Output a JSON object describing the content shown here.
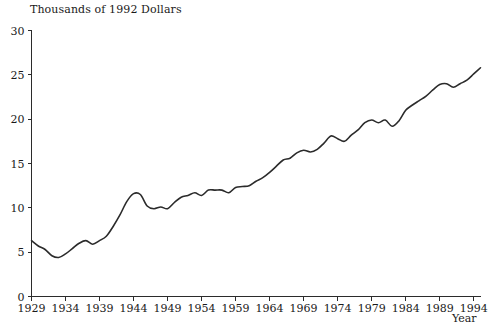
{
  "chart_data": {
    "type": "line",
    "title": "Thousands of 1992 Dollars",
    "subtitle": "",
    "xlabel": "Year",
    "ylabel": "",
    "xlim": [
      1929,
      1995
    ],
    "ylim": [
      0,
      30
    ],
    "grid": false,
    "legend": "none",
    "line_color": "#2b2b2b",
    "x_ticks": [
      1929,
      1934,
      1939,
      1944,
      1949,
      1954,
      1959,
      1964,
      1969,
      1974,
      1979,
      1984,
      1989,
      1994
    ],
    "x_tick_labels": [
      "1929",
      "1934",
      "1939",
      "1944",
      "1949",
      "1954",
      "1959",
      "1964",
      "1969",
      "1974",
      "1979",
      "1984",
      "1989",
      "1994"
    ],
    "y_ticks": [
      0,
      5,
      10,
      15,
      20,
      25,
      30
    ],
    "y_tick_labels": [
      "0",
      "5",
      "10",
      "15",
      "20",
      "25",
      "30"
    ],
    "series": [
      {
        "name": "Real GDP per capita",
        "x": [
          1929,
          1930,
          1931,
          1932,
          1933,
          1934,
          1935,
          1936,
          1937,
          1938,
          1939,
          1940,
          1941,
          1942,
          1943,
          1944,
          1945,
          1946,
          1947,
          1948,
          1949,
          1950,
          1951,
          1952,
          1953,
          1954,
          1955,
          1956,
          1957,
          1958,
          1959,
          1960,
          1961,
          1962,
          1963,
          1964,
          1965,
          1966,
          1967,
          1968,
          1969,
          1970,
          1971,
          1972,
          1973,
          1974,
          1975,
          1976,
          1977,
          1978,
          1979,
          1980,
          1981,
          1982,
          1983,
          1984,
          1985,
          1986,
          1987,
          1988,
          1989,
          1990,
          1991,
          1992,
          1993,
          1994,
          1995
        ],
        "y": [
          6.3,
          5.7,
          5.3,
          4.6,
          4.4,
          4.8,
          5.4,
          6.0,
          6.3,
          5.9,
          6.3,
          6.8,
          7.9,
          9.2,
          10.7,
          11.6,
          11.5,
          10.2,
          9.9,
          10.1,
          9.9,
          10.6,
          11.2,
          11.4,
          11.7,
          11.4,
          12.0,
          12.0,
          12.0,
          11.7,
          12.3,
          12.4,
          12.5,
          13.0,
          13.4,
          14.0,
          14.7,
          15.4,
          15.6,
          16.2,
          16.5,
          16.3,
          16.6,
          17.3,
          18.1,
          17.8,
          17.5,
          18.2,
          18.8,
          19.6,
          19.9,
          19.6,
          19.9,
          19.2,
          19.8,
          21.0,
          21.6,
          22.1,
          22.6,
          23.3,
          23.9,
          24.0,
          23.6,
          24.0,
          24.4,
          25.1,
          25.8
        ]
      }
    ]
  },
  "axes": {
    "x_axis_name": "year-axis",
    "y_axis_name": "value-axis"
  }
}
